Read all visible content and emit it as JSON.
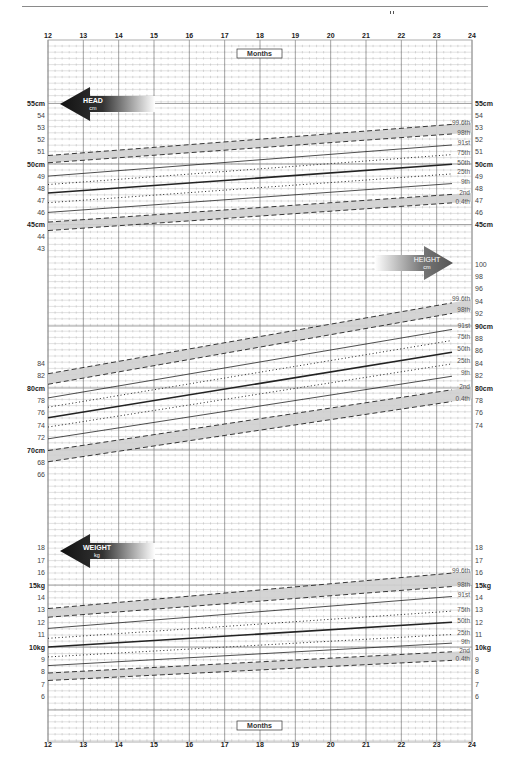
{
  "chart_data": {
    "type": "line",
    "title": "",
    "xlabel": "Months",
    "x_ticks": [
      12,
      13,
      14,
      15,
      16,
      17,
      18,
      19,
      20,
      21,
      22,
      23,
      24
    ],
    "xlim": [
      12,
      24
    ],
    "grid": true,
    "panels": [
      {
        "name": "HEAD",
        "unit": "cm",
        "ylabel": "HEAD cm",
        "ylim": [
          43,
          55
        ],
        "left_ticks": [
          "55cm",
          "54",
          "53",
          "52",
          "51",
          "50cm",
          "49",
          "48",
          "47",
          "46",
          "45cm",
          "44",
          "43"
        ],
        "right_ticks": [
          "55cm",
          "54",
          "53",
          "52",
          "51",
          "50cm",
          "49",
          "48",
          "47",
          "46",
          "45cm"
        ],
        "x": [
          12,
          24
        ],
        "series": [
          {
            "name": "99.6th",
            "values": [
              50.7,
              53.4
            ],
            "style": "dashed"
          },
          {
            "name": "98th",
            "values": [
              50.1,
              52.6
            ],
            "style": "dashed"
          },
          {
            "name": "91st",
            "values": [
              49.0,
              51.7
            ],
            "style": "solid"
          },
          {
            "name": "75th",
            "values": [
              48.3,
              50.9
            ],
            "style": "dotted"
          },
          {
            "name": "50th",
            "values": [
              47.6,
              50.1
            ],
            "style": "bold"
          },
          {
            "name": "25th",
            "values": [
              46.8,
              49.3
            ],
            "style": "dotted"
          },
          {
            "name": "9th",
            "values": [
              46.0,
              48.5
            ],
            "style": "solid"
          },
          {
            "name": "2nd",
            "values": [
              45.2,
              47.6
            ],
            "style": "dashed"
          },
          {
            "name": "0.4th",
            "values": [
              44.5,
              46.9
            ],
            "style": "dashed"
          }
        ]
      },
      {
        "name": "HEIGHT",
        "unit": "cm",
        "ylabel": "HEIGHT cm",
        "ylim": [
          66,
          100
        ],
        "left_ticks": [
          "84",
          "82",
          "80cm",
          "78",
          "76",
          "74",
          "72",
          "70cm",
          "68",
          "66"
        ],
        "right_ticks": [
          "100",
          "98",
          "96",
          "94",
          "92",
          "90cm",
          "88",
          "86",
          "84",
          "82",
          "80cm",
          "78",
          "76",
          "74"
        ],
        "x": [
          12,
          24
        ],
        "series": [
          {
            "name": "99.6th",
            "values": [
              82.3,
              94.3
            ],
            "style": "dashed"
          },
          {
            "name": "98th",
            "values": [
              80.6,
              92.6
            ],
            "style": "dashed"
          },
          {
            "name": "91st",
            "values": [
              78.4,
              90.0
            ],
            "style": "solid"
          },
          {
            "name": "75th",
            "values": [
              76.9,
              88.2
            ],
            "style": "dotted"
          },
          {
            "name": "50th",
            "values": [
              75.2,
              86.3
            ],
            "style": "bold"
          },
          {
            "name": "25th",
            "values": [
              73.7,
              84.4
            ],
            "style": "dotted"
          },
          {
            "name": "9th",
            "values": [
              71.8,
              82.4
            ],
            "style": "solid"
          },
          {
            "name": "2nd",
            "values": [
              69.9,
              80.2
            ],
            "style": "dashed"
          },
          {
            "name": "0.4th",
            "values": [
              68.1,
              78.3
            ],
            "style": "dashed"
          }
        ]
      },
      {
        "name": "WEIGHT",
        "unit": "kg",
        "ylabel": "WEIGHT kg",
        "ylim": [
          6,
          18
        ],
        "left_ticks": [
          "18",
          "17",
          "16",
          "15kg",
          "14",
          "13",
          "12",
          "11",
          "10kg",
          "9",
          "8",
          "7",
          "6"
        ],
        "right_ticks": [
          "18",
          "17",
          "16",
          "15kg",
          "14",
          "13",
          "12",
          "11",
          "10kg",
          "9",
          "8",
          "7",
          "6"
        ],
        "x": [
          12,
          24
        ],
        "series": [
          {
            "name": "99.6th",
            "values": [
              13.1,
              16.1
            ],
            "style": "dashed"
          },
          {
            "name": "98th",
            "values": [
              12.4,
              15.0
            ],
            "style": "dashed"
          },
          {
            "name": "91st",
            "values": [
              11.5,
              14.2
            ],
            "style": "solid"
          },
          {
            "name": "75th",
            "values": [
              10.7,
              13.0
            ],
            "style": "dotted"
          },
          {
            "name": "50th",
            "values": [
              10.0,
              12.1
            ],
            "style": "bold"
          },
          {
            "name": "25th",
            "values": [
              9.2,
              11.1
            ],
            "style": "dotted"
          },
          {
            "name": "9th",
            "values": [
              8.5,
              10.4
            ],
            "style": "solid"
          },
          {
            "name": "2nd",
            "values": [
              7.9,
              9.7
            ],
            "style": "dashed"
          },
          {
            "name": "0.4th",
            "values": [
              7.3,
              9.0
            ],
            "style": "dashed"
          }
        ]
      }
    ],
    "legend_position": "right-end labels on curves"
  },
  "labels": {
    "months_top": "Months",
    "months_bottom": "Months",
    "head_arrow": {
      "line1": "HEAD",
      "line2": "cm"
    },
    "height_arrow": {
      "line1": "HEIGHT",
      "line2": "cm"
    },
    "weight_arrow": {
      "line1": "WEIGHT",
      "line2": "kg"
    }
  },
  "colors": {
    "grid": "#9a9a9a",
    "band": "#cfcfcf",
    "curve": "#222222",
    "arrow_dark": "#111111"
  }
}
